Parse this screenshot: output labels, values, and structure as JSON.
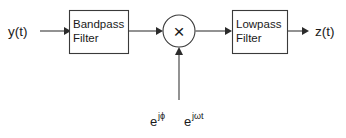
{
  "diagram": {
    "background_color": "#ffffff",
    "line_color": "#3a3a3a",
    "text_color": "#1a1a1a",
    "input": {
      "label": "y(t)"
    },
    "output": {
      "label": "z(t)"
    },
    "blocks": [
      {
        "id": "bandpass",
        "line1": "Bandpass",
        "line2": "Filter"
      },
      {
        "id": "lowpass",
        "line1": "Lowpass",
        "line2": "Filter"
      }
    ],
    "multiplier": {
      "symbol": "×"
    },
    "oscillator": {
      "term1_base": "e",
      "term1_exponent": "jϕ",
      "term2_base": "e",
      "term2_exponent": "jωt"
    }
  }
}
